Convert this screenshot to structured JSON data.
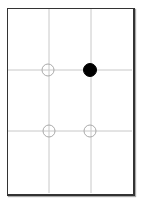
{
  "diagram": {
    "grid_color": "#c8c8c8",
    "frame_color": "#333333",
    "points": [
      {
        "name": "top-left",
        "x": 48,
        "y": 70,
        "filled": false
      },
      {
        "name": "top-right",
        "x": 90,
        "y": 70,
        "filled": true
      },
      {
        "name": "bottom-left",
        "x": 49,
        "y": 131,
        "filled": false
      },
      {
        "name": "bottom-right",
        "x": 90,
        "y": 131,
        "filled": false
      }
    ]
  }
}
